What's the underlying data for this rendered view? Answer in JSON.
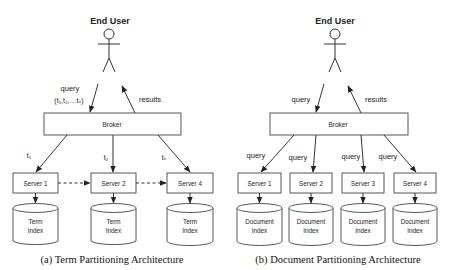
{
  "panels": [
    {
      "id": "a",
      "caption": "(a) Term Partitioning Architecture",
      "user_label": "End User",
      "query_label": "query",
      "query_terms": "(t₁,t₂,…tₙ)",
      "results_label": "results",
      "broker_label": "Broker",
      "edge_labels": [
        "t₁",
        "t₂",
        "tₙ"
      ],
      "servers": [
        "Server 1",
        "Server 2",
        "Server 4"
      ],
      "index_line1": "Term",
      "index_line2": "Index"
    },
    {
      "id": "b",
      "caption": "(b) Document Partitioning Architecture",
      "user_label": "End User",
      "query_label": "query",
      "results_label": "results",
      "broker_label": "Broker",
      "edge_labels": [
        "query",
        "query",
        "query",
        "query"
      ],
      "servers": [
        "Server 1",
        "Server 2",
        "Server 3",
        "Server 4"
      ],
      "index_line1": "Document",
      "index_line2": "Index"
    }
  ]
}
